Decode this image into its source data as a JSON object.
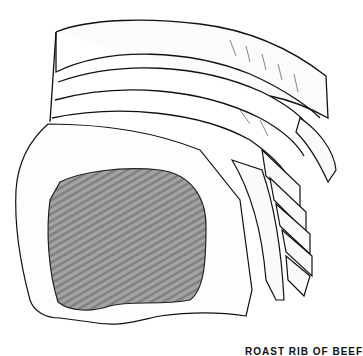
{
  "illustration": {
    "subject": "Roast rib of beef",
    "style": "black-and-white pen-and-ink drawing",
    "colors": {
      "ink": "#111111",
      "background": "#ffffff",
      "meat_shade": "#8a8a8a"
    }
  },
  "caption": {
    "text": "ROAST RIB OF BEEF"
  }
}
